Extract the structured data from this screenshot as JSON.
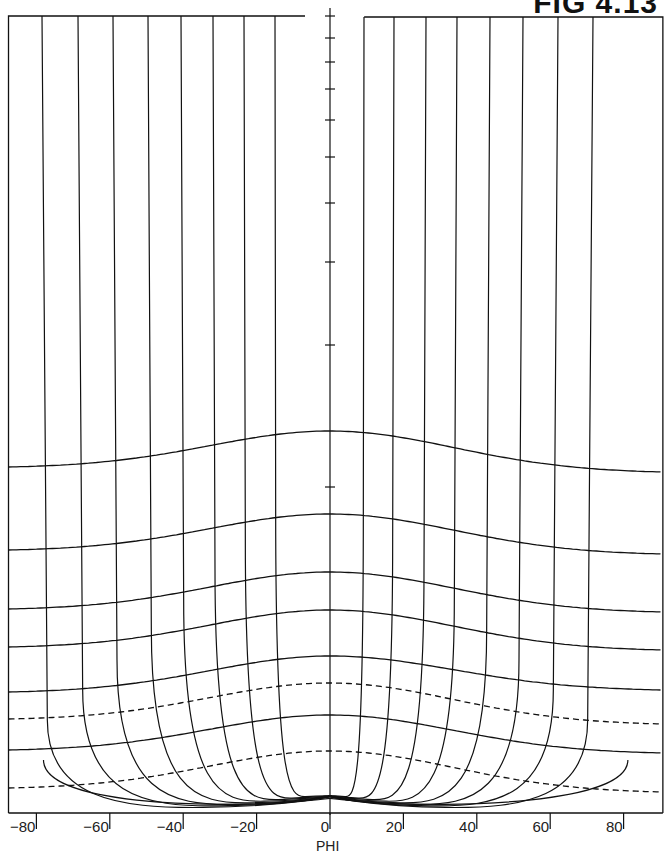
{
  "chart_data": {
    "type": "line",
    "title": "FIG 4.13",
    "xlabel": "PHI",
    "ylabel": "",
    "xlim": [
      -90,
      90
    ],
    "grid": false,
    "x_ticks": [
      -80,
      -60,
      -40,
      -20,
      0,
      20,
      40,
      60,
      80
    ],
    "x_tick_labels": [
      "−80",
      "−60",
      "−40",
      "−20",
      "0",
      "20",
      "40",
      "60",
      "80"
    ],
    "meridians_phi": [
      -90,
      -80,
      -70,
      -60,
      -50,
      -40,
      -30,
      -20,
      -10,
      10,
      20,
      30,
      40,
      50,
      60,
      70,
      80,
      90
    ],
    "parallels": [
      {
        "style": "solid",
        "center_y": 431,
        "edge_y_left": 467,
        "edge_y_right": 472
      },
      {
        "style": "solid",
        "center_y": 514,
        "edge_y_left": 550,
        "edge_y_right": 554
      },
      {
        "style": "solid",
        "center_y": 572,
        "edge_y_left": 609,
        "edge_y_right": 612
      },
      {
        "style": "solid",
        "center_y": 610,
        "edge_y_left": 647,
        "edge_y_right": 650
      },
      {
        "style": "solid",
        "center_y": 656,
        "edge_y_left": 692,
        "edge_y_right": 690
      },
      {
        "style": "dashed",
        "center_y": 683,
        "edge_y_left": 719,
        "edge_y_right": 724
      },
      {
        "style": "solid",
        "center_y": 715,
        "edge_y_left": 750,
        "edge_y_right": 753
      },
      {
        "style": "dashed",
        "center_y": 751,
        "edge_y_left": 788,
        "edge_y_right": 792
      }
    ],
    "central_axis_ticks_y": [
      16,
      38,
      62,
      89,
      120,
      157,
      203,
      262,
      345,
      487
    ],
    "pole": {
      "phi": 0,
      "y": 796
    },
    "annotations": []
  },
  "labels": {
    "title": "FIG 4.13",
    "xlabel": "PHI",
    "ticks": [
      "−80",
      "−60",
      "−40",
      "−20",
      "0",
      "20",
      "40",
      "60",
      "80"
    ]
  }
}
